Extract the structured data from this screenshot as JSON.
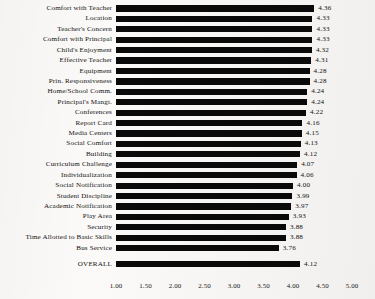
{
  "chart_data": {
    "type": "bar",
    "orientation": "horizontal",
    "title": "",
    "xlabel": "",
    "ylabel": "",
    "xlim": [
      1.0,
      5.0
    ],
    "xticks": [
      "1.00",
      "1.50",
      "2.00",
      "2.50",
      "3.00",
      "3.50",
      "4.00",
      "4.50",
      "5.00"
    ],
    "xtick_values": [
      1.0,
      1.5,
      2.0,
      2.5,
      3.0,
      3.5,
      4.0,
      4.5,
      5.0
    ],
    "grid": false,
    "legend": "none",
    "bar_color": "#0a0a0a",
    "background_color": "#fbfaf8",
    "value_label_format": "0.00",
    "categories": [
      "Comfort with Teacher",
      "Location",
      "Teacher's Concern",
      "Comfort with Principal",
      "Child's Enjoyment",
      "Effective Teacher",
      "Equipment",
      "Prin. Responsiveness",
      "Home/School Comm.",
      "Principal's Mangt.",
      "Conferences",
      "Report Card",
      "Media Centers",
      "Social Comfort",
      "Building",
      "Curriculum Challenge",
      "Individualization",
      "Social Notification",
      "Student Discipline",
      "Academic Notification",
      "Play Area",
      "Security",
      "Time Allotted to Basic Skills",
      "Bus Service"
    ],
    "values": [
      4.36,
      4.33,
      4.33,
      4.33,
      4.32,
      4.31,
      4.28,
      4.28,
      4.24,
      4.24,
      4.22,
      4.16,
      4.15,
      4.13,
      4.12,
      4.07,
      4.06,
      4.0,
      3.99,
      3.97,
      3.93,
      3.88,
      3.88,
      3.76
    ],
    "value_labels": [
      "4.36",
      "4.33",
      "4.33",
      "4.33",
      "4.32",
      "4.31",
      "4.28",
      "4.28",
      "4.24",
      "4.24",
      "4.22",
      "4.16",
      "4.15",
      "4.13",
      "4.12",
      "4.07",
      "4.06",
      "4.00",
      "3.99",
      "3.97",
      "3.93",
      "3.88",
      "3.88",
      "3.76"
    ],
    "summary_row": {
      "category": "OVERALL",
      "value": 4.12,
      "value_label": "4.12"
    }
  }
}
